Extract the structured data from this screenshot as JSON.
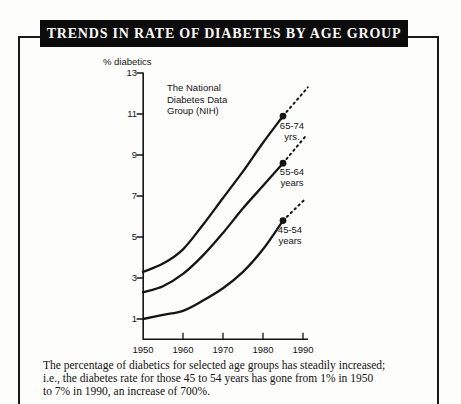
{
  "header": {
    "title": "TRENDS IN RATE OF DIABETES BY AGE GROUP"
  },
  "chart_data": {
    "type": "line",
    "title": "TRENDS IN RATE OF DIABETES BY AGE GROUP",
    "ylabel": "% diabetics",
    "xlabel": "",
    "annotation": "The National\nDiabetes Data\nGroup (NIH)",
    "x_ticks": [
      "1950",
      "1960",
      "1970",
      "1980",
      "1990"
    ],
    "y_ticks": [
      "13",
      "11",
      "9",
      "7",
      "5",
      "3",
      "1"
    ],
    "xlim": [
      1950,
      1991.5
    ],
    "ylim": [
      0,
      13
    ],
    "grid": false,
    "legend_position": "labels-on-lines",
    "line_color": "#151515",
    "x": [
      1950,
      1955,
      1960,
      1965,
      1970,
      1975,
      1980,
      1985
    ],
    "series": [
      {
        "name": "65-74 yrs.",
        "label": "65-74\nyrs.",
        "values": [
          3.3,
          3.7,
          4.4,
          5.6,
          6.9,
          8.2,
          9.6,
          10.9
        ],
        "marker": {
          "x": 1985,
          "value": 10.9
        },
        "projection": {
          "x": [
            1985,
            1991.2
          ],
          "values": [
            10.9,
            12.3
          ],
          "style": "dotted"
        }
      },
      {
        "name": "55-64 years",
        "label": "55-64\nyears",
        "values": [
          2.3,
          2.6,
          3.2,
          4.1,
          5.2,
          6.4,
          7.5,
          8.6
        ],
        "marker": {
          "x": 1985,
          "value": 8.6
        },
        "projection": {
          "x": [
            1985,
            1991
          ],
          "values": [
            8.6,
            10.0
          ],
          "style": "dotted"
        }
      },
      {
        "name": "45-54 years",
        "label": "45-54\nyears",
        "values": [
          1.0,
          1.2,
          1.4,
          1.9,
          2.5,
          3.3,
          4.4,
          5.8
        ],
        "marker": {
          "x": 1985,
          "value": 5.8
        },
        "projection": {
          "x": [
            1985,
            1990.8
          ],
          "values": [
            5.8,
            6.9
          ],
          "style": "dotted"
        }
      }
    ]
  },
  "caption": {
    "text": "The percentage of diabetics for selected age groups has steadily increased;\ni.e., the diabetes rate for those 45 to 54 years has gone from 1% in 1950\nto 7% in 1990, an increase of 700%."
  }
}
